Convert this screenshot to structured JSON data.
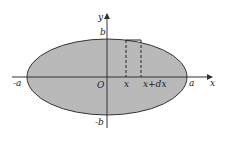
{
  "diagram": {
    "type": "ellipse-area-element",
    "axes": {
      "x_label": "x",
      "y_label": "y",
      "origin_label": "O"
    },
    "ellipse": {
      "fill": "#b9b9b9",
      "stroke": "#333333"
    },
    "tick_labels": {
      "b_top": "b",
      "b_bottom": "-b",
      "a_left": "-a",
      "a_right": "a"
    },
    "strip": {
      "left_label": "x",
      "right_label": "x+dx"
    }
  }
}
